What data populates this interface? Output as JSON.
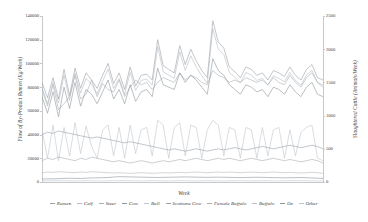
{
  "chart_data": {
    "type": "line",
    "title": "",
    "xlabel": "Week",
    "ylabel": "Flow of By-Product Rumen (Kg/Week)",
    "ylabel_right": "Slaughtered Cattle (Animals/Week)",
    "grid": false,
    "legend_position": "bottom",
    "ylim": [
      0,
      140000
    ],
    "yticks": [
      "0",
      "20000",
      "40000",
      "60000",
      "80000",
      "100000",
      "120000",
      "140000"
    ],
    "ylim_right": [
      0,
      2500
    ],
    "yticks_right": [
      "0",
      "500",
      "1000",
      "1500",
      "2000",
      "2500"
    ],
    "xlim": [
      1,
      52
    ],
    "xticks": [],
    "n_points": 52,
    "series": [
      {
        "name": "Rumen",
        "axis": "left",
        "color": "#9aa0a6",
        "values": [
          84000,
          71000,
          88000,
          70000,
          95000,
          73000,
          96000,
          79000,
          92000,
          86000,
          79000,
          90000,
          100000,
          83000,
          92000,
          78000,
          97000,
          81000,
          90000,
          91000,
          86000,
          120000,
          98000,
          95000,
          92000,
          115000,
          99000,
          112000,
          102000,
          94000,
          88000,
          136000,
          118000,
          113000,
          97000,
          93000,
          88000,
          97000,
          95000,
          90000,
          92000,
          86000,
          94000,
          92000,
          89000,
          97000,
          90000,
          86000,
          95000,
          99000,
          88000,
          86000
        ]
      },
      {
        "name": "Calf",
        "axis": "right",
        "color": "#b6bcc2",
        "values": [
          1420,
          1180,
          1500,
          1190,
          1610,
          1230,
          1640,
          1340,
          1560,
          1470,
          1330,
          1520,
          1700,
          1410,
          1560,
          1320,
          1650,
          1380,
          1530,
          1550,
          1460,
          2040,
          1660,
          1610,
          1560,
          1960,
          1680,
          1900,
          1730,
          1600,
          1490,
          2310,
          2000,
          1920,
          1650,
          1580,
          1490,
          1650,
          1610,
          1530,
          1560,
          1460,
          1600,
          1560,
          1510,
          1650,
          1530,
          1460,
          1610,
          1680,
          1500,
          1460
        ]
      },
      {
        "name": "Steer",
        "axis": "left",
        "color": "#a8aeb4",
        "values": [
          78000,
          64000,
          82000,
          61000,
          66000,
          72000,
          90000,
          70000,
          74000,
          86000,
          72000,
          83000,
          78000,
          76000,
          86000,
          72000,
          80000,
          86000,
          82000,
          84000,
          78000,
          84000,
          88000,
          86000,
          84000,
          92000,
          86000,
          90000,
          88000,
          84000,
          82000,
          94000,
          90000,
          88000,
          84000,
          86000,
          84000,
          88000,
          86000,
          84000,
          86000,
          82000,
          88000,
          84000,
          82000,
          90000,
          84000,
          80000,
          88000,
          92000,
          84000,
          80000
        ]
      },
      {
        "name": "Cow",
        "axis": "left",
        "color": "#8f959b",
        "values": [
          72000,
          58000,
          76000,
          55000,
          80000,
          62000,
          84000,
          64000,
          78000,
          74000,
          66000,
          76000,
          86000,
          70000,
          78000,
          66000,
          82000,
          68000,
          76000,
          78000,
          72000,
          96000,
          82000,
          80000,
          78000,
          92000,
          84000,
          90000,
          86000,
          80000,
          74000,
          104000,
          94000,
          90000,
          82000,
          78000,
          74000,
          82000,
          80000,
          76000,
          78000,
          72000,
          80000,
          78000,
          74000,
          82000,
          76000,
          72000,
          80000,
          84000,
          74000,
          72000
        ]
      },
      {
        "name": "Bull",
        "axis": "left",
        "color": "#c0c6cc",
        "values": [
          44000,
          20000,
          48000,
          18000,
          46000,
          22000,
          50000,
          24000,
          47000,
          30000,
          20000,
          44000,
          48000,
          22000,
          46000,
          20000,
          48000,
          24000,
          44000,
          46000,
          22000,
          52000,
          48000,
          20000,
          46000,
          50000,
          22000,
          48000,
          46000,
          20000,
          44000,
          52000,
          48000,
          22000,
          46000,
          44000,
          20000,
          46000,
          44000,
          20000,
          46000,
          22000,
          44000,
          46000,
          20000,
          44000,
          22000,
          42000,
          46000,
          48000,
          20000,
          18000
        ]
      },
      {
        "name": "Scottona Cow",
        "axis": "left",
        "color": "#9aa0a6",
        "values": [
          40000,
          42000,
          41000,
          43000,
          42000,
          41000,
          40000,
          39000,
          38000,
          37000,
          38000,
          37000,
          36000,
          35000,
          34000,
          33000,
          34000,
          33000,
          32000,
          31000,
          30000,
          29000,
          28000,
          27000,
          28000,
          27000,
          26000,
          27000,
          28000,
          27000,
          26000,
          27000,
          28000,
          27000,
          28000,
          29000,
          28000,
          27000,
          28000,
          29000,
          30000,
          29000,
          28000,
          29000,
          30000,
          31000,
          30000,
          29000,
          30000,
          31000,
          30000,
          28000
        ]
      },
      {
        "name": "Female Buffalo",
        "axis": "left",
        "color": "#a8aeb4",
        "values": [
          18000,
          20000,
          19000,
          21000,
          20000,
          19000,
          18000,
          20000,
          19000,
          21000,
          20000,
          19000,
          18000,
          17000,
          18000,
          17000,
          16000,
          17000,
          18000,
          17000,
          16000,
          17000,
          18000,
          17000,
          18000,
          19000,
          18000,
          19000,
          20000,
          19000,
          18000,
          19000,
          20000,
          19000,
          20000,
          19000,
          18000,
          19000,
          20000,
          19000,
          18000,
          19000,
          20000,
          19000,
          18000,
          19000,
          18000,
          17000,
          18000,
          19000,
          18000,
          16000
        ]
      },
      {
        "name": "Buffalo",
        "axis": "right",
        "color": "#b6bcc2",
        "values": [
          140,
          150,
          145,
          155,
          150,
          145,
          140,
          150,
          145,
          155,
          150,
          145,
          140,
          135,
          140,
          135,
          130,
          135,
          140,
          135,
          130,
          135,
          140,
          135,
          140,
          145,
          140,
          145,
          150,
          145,
          140,
          145,
          150,
          145,
          150,
          145,
          140,
          145,
          150,
          145,
          140,
          145,
          150,
          145,
          140,
          145,
          140,
          135,
          140,
          145,
          140,
          130
        ]
      },
      {
        "name": "Ox",
        "axis": "left",
        "color": "#8f959b",
        "values": [
          2500,
          2600,
          2700,
          2800,
          3000,
          3200,
          3100,
          3000,
          3200,
          3400,
          3500,
          3600,
          3800,
          4200,
          4500,
          4400,
          4300,
          4200,
          4100,
          4000,
          3900,
          3800,
          3900,
          4000,
          4100,
          4200,
          4300,
          4200,
          4100,
          4000,
          3900,
          4000,
          4100,
          4000,
          3900,
          3800,
          3700,
          3800,
          3900,
          4000,
          3900,
          3800,
          3700,
          3600,
          3500,
          3600,
          3700,
          3800,
          3600,
          3400,
          3200,
          3000
        ]
      },
      {
        "name": "Other",
        "axis": "left",
        "color": "#c0c6cc",
        "values": [
          900,
          950,
          1000,
          1100,
          1000,
          950,
          900,
          1000,
          1100,
          1000,
          950,
          900,
          1000,
          1100,
          1200,
          1100,
          1000,
          950,
          900,
          1000,
          1100,
          1000,
          950,
          900,
          1000,
          1100,
          1000,
          950,
          900,
          1000,
          1100,
          1000,
          950,
          900,
          1000,
          1100,
          1000,
          950,
          900,
          1000,
          1100,
          1000,
          950,
          900,
          1000,
          1100,
          1200,
          1100,
          1000,
          950,
          900,
          850
        ]
      }
    ]
  },
  "legend": {
    "items": [
      {
        "label": "Rumen"
      },
      {
        "label": "Calf"
      },
      {
        "label": "Steer"
      },
      {
        "label": "Cow"
      },
      {
        "label": "Bull"
      },
      {
        "label": "Scottona Cow"
      },
      {
        "label": "Female Buffalo"
      },
      {
        "label": "Buffalo"
      },
      {
        "label": "Ox"
      },
      {
        "label": "Other"
      }
    ]
  }
}
